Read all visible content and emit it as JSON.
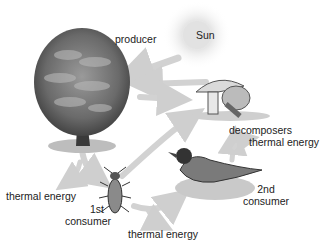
{
  "diagram": {
    "labels": {
      "sun": "Sun",
      "producer": "producer",
      "decomposers": "decomposers",
      "thermal_decomposers": "thermal energy",
      "thermal_producer": "thermal energy",
      "consumer1_a": "1st",
      "consumer1_b": "consumer",
      "consumer2_a": "2nd",
      "consumer2_b": "consumer",
      "thermal_consumer1": "thermal energy"
    },
    "nodes": [
      {
        "id": "sun",
        "icon": "sun-icon"
      },
      {
        "id": "producer",
        "icon": "tree-icon"
      },
      {
        "id": "decomposers",
        "icon": "mushroom-icon"
      },
      {
        "id": "consumer1",
        "icon": "beetle-icon"
      },
      {
        "id": "consumer2",
        "icon": "bird-icon"
      }
    ],
    "edges": [
      {
        "from": "sun",
        "to": "producer"
      },
      {
        "from": "decomposers",
        "to": "producer"
      },
      {
        "from": "producer",
        "to": "decomposers"
      },
      {
        "from": "producer",
        "to": "consumer1"
      },
      {
        "from": "consumer1",
        "to": "consumer2"
      },
      {
        "from": "consumer1",
        "to": "decomposers"
      },
      {
        "from": "consumer2",
        "to": "decomposers"
      },
      {
        "from": "producer",
        "to": "thermal energy"
      },
      {
        "from": "consumer1",
        "to": "thermal energy"
      },
      {
        "from": "decomposers",
        "to": "thermal energy"
      }
    ],
    "colors": {
      "arrow": "#d0d0d0",
      "sun_glow": "#e4e4e4",
      "text": "#222222"
    }
  }
}
